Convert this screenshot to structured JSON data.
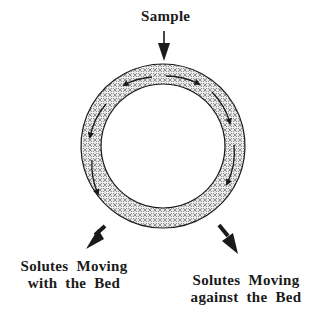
{
  "diagram": {
    "type": "annular column schematic",
    "labels": {
      "top": "Sample",
      "bottom_left": [
        "Solutes Moving",
        "with the Bed"
      ],
      "bottom_right": [
        "Solutes Moving",
        "against the Bed"
      ]
    },
    "colors": {
      "ink": "#1a1a1a",
      "ring_fill": "#bdbdbd",
      "background": "#ffffff"
    }
  }
}
